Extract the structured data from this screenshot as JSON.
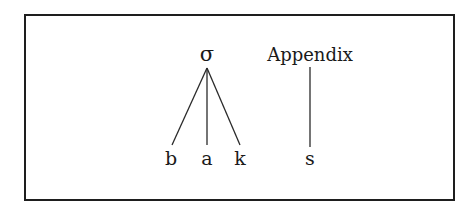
{
  "diagram": {
    "type": "syllable-tree",
    "root": {
      "label": "σ"
    },
    "appendix": {
      "label": "Appendix"
    },
    "leaves": [
      {
        "label": "b",
        "parent": "σ"
      },
      {
        "label": "a",
        "parent": "σ"
      },
      {
        "label": "k",
        "parent": "σ"
      },
      {
        "label": "s",
        "parent": "Appendix"
      }
    ],
    "colors": {
      "line": "#2a2a2a",
      "text": "#1a1a1a",
      "border": "#1e1e1e",
      "background": "#ffffff"
    }
  }
}
